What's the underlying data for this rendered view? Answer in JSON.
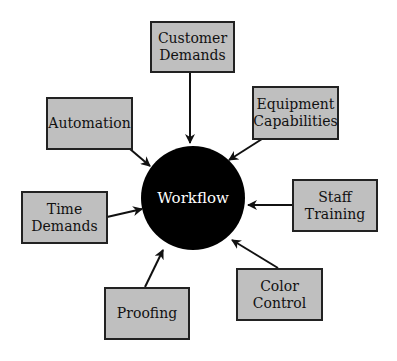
{
  "diagram": {
    "center": {
      "label": "Workflow",
      "fill": "#000000",
      "text_color": "#ffffff"
    },
    "box_fill": "#bfbfbf",
    "nodes": [
      {
        "id": "customer-demands",
        "label": "Customer Demands"
      },
      {
        "id": "equipment-capabilities",
        "label": "Equipment Capabilities"
      },
      {
        "id": "staff-training",
        "label": "Staff Training"
      },
      {
        "id": "color-control",
        "label": "Color Control"
      },
      {
        "id": "proofing",
        "label": "Proofing"
      },
      {
        "id": "time-demands",
        "label": "Time Demands"
      },
      {
        "id": "automation",
        "label": "Automation"
      }
    ],
    "edges_direction": "all nodes point to center"
  }
}
